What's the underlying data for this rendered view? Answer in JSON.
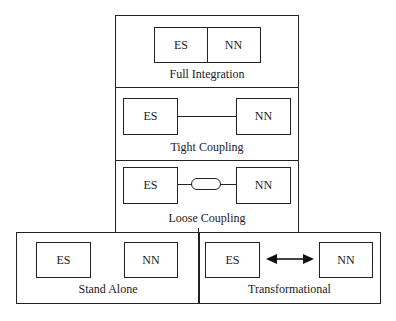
{
  "diagram": {
    "title": "",
    "nodes_label_es": "ES",
    "nodes_label_nn": "NN",
    "panels": [
      {
        "id": "full-integration",
        "label": "Full Integration",
        "connection": "merged"
      },
      {
        "id": "tight-coupling",
        "label": "Tight Coupling",
        "connection": "line"
      },
      {
        "id": "loose-coupling",
        "label": "Loose Coupling",
        "connection": "line-with-pill"
      },
      {
        "id": "stand-alone",
        "label": "Stand Alone",
        "connection": "none"
      },
      {
        "id": "transformational",
        "label": "Transformational",
        "connection": "double-arrow"
      }
    ],
    "stroke_color": "#222222",
    "background": "#ffffff"
  }
}
